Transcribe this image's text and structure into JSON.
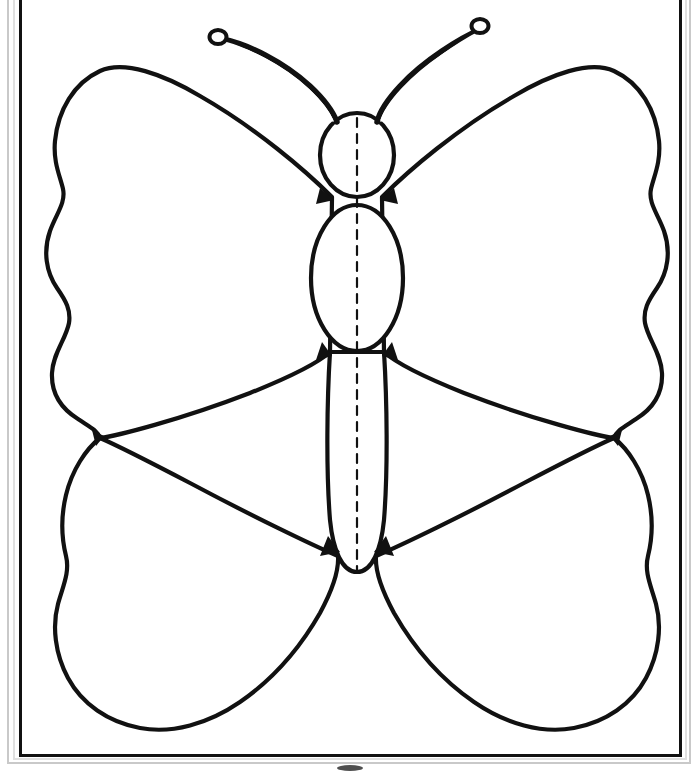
{
  "page": {
    "title": "Butterfly Symmetry Template",
    "kind": "line-art-worksheet",
    "width": 697,
    "height": 773,
    "background_color": "#ffffff",
    "ink_color": "#111111"
  },
  "frame": {
    "name": "page-border",
    "style": "double-rule rectangle",
    "outer": {
      "x": 6,
      "y": 0,
      "width": 686,
      "height": 768
    },
    "inner": {
      "x": 20,
      "y": 0,
      "width": 660,
      "height": 756
    },
    "outer_stroke_color": "#bdbdbd",
    "inner_stroke_color": "#111111",
    "inner_stroke_width": 3
  },
  "figure": {
    "name": "butterfly",
    "fill_color": "#ffffff",
    "stroke_color": "#111111",
    "axis_of_symmetry_x": 357,
    "parts": [
      {
        "name": "antenna-left",
        "label": "Left antenna",
        "tip": "clubbed"
      },
      {
        "name": "antenna-right",
        "label": "Right antenna",
        "tip": "clubbed"
      },
      {
        "name": "head",
        "label": "Head",
        "shape": "oval",
        "cx": 357,
        "cy": 155,
        "rx": 37,
        "ry": 42
      },
      {
        "name": "thorax",
        "label": "Thorax",
        "shape": "oval",
        "cx": 357,
        "cy": 278,
        "rx": 45,
        "ry": 72
      },
      {
        "name": "abdomen",
        "label": "Abdomen",
        "shape": "rounded-taper",
        "cx": 357,
        "cy": 440,
        "width": 60,
        "bottom_y": 573
      },
      {
        "name": "forewing-left",
        "label": "Upper left wing",
        "edge": "scalloped"
      },
      {
        "name": "forewing-right",
        "label": "Upper right wing",
        "edge": "scalloped"
      },
      {
        "name": "hindwing-left",
        "label": "Lower left wing",
        "edge": "scalloped"
      },
      {
        "name": "hindwing-right",
        "label": "Lower right wing",
        "edge": "scalloped"
      }
    ]
  },
  "symmetry_line": {
    "name": "fold-line",
    "label": "Line of symmetry",
    "style": "dashed",
    "x": 357,
    "y_top": 118,
    "y_bottom": 572,
    "dash": "9 7",
    "stroke_width": 2.2,
    "color": "#111111"
  },
  "marks": [
    {
      "name": "page-smudge",
      "label": "Scan smudge",
      "x": 350,
      "y": 768,
      "rx": 13,
      "ry": 3,
      "color": "#303030"
    }
  ]
}
